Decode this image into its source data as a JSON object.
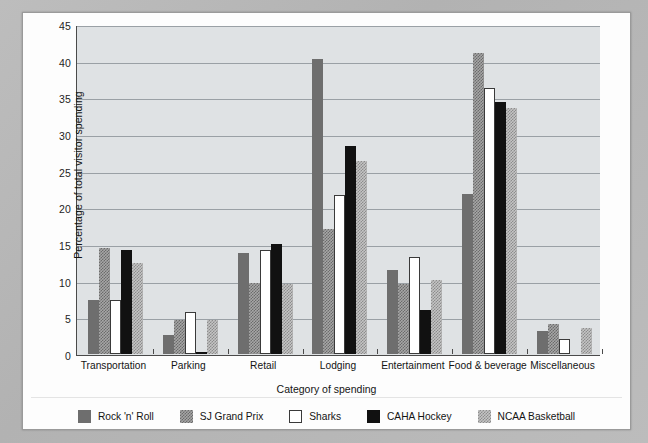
{
  "chart_data": {
    "type": "bar",
    "title": "",
    "xlabel": "Category of spending",
    "ylabel": "Percentage of total visitor spending",
    "ylim": [
      0,
      45
    ],
    "yticks": [
      0,
      5,
      10,
      15,
      20,
      25,
      30,
      35,
      40,
      45
    ],
    "grid": true,
    "legend_position": "bottom",
    "categories": [
      "Transportation",
      "Parking",
      "Retail",
      "Lodging",
      "Entertainment",
      "Food & beverage",
      "Miscellaneous"
    ],
    "series": [
      {
        "name": "Rock 'n' Roll",
        "swatch": "solid-dark-gray",
        "color": "#6e6e6e",
        "values": [
          7.3,
          2.6,
          13.8,
          40.2,
          11.5,
          21.8,
          3.1
        ]
      },
      {
        "name": "SJ Grand Prix",
        "swatch": "checker-mid-gray",
        "color": "#a6a6a6",
        "values": [
          14.4,
          4.7,
          9.7,
          17.1,
          9.5,
          41.0,
          4.1
        ]
      },
      {
        "name": "Sharks",
        "swatch": "white-outlined",
        "color": "#ffffff",
        "values": [
          7.4,
          5.7,
          14.2,
          21.7,
          13.2,
          36.3,
          2.0
        ]
      },
      {
        "name": "CAHA Hockey",
        "swatch": "solid-black",
        "color": "#111111",
        "values": [
          14.2,
          0.3,
          15.0,
          28.3,
          6.0,
          34.4,
          0.0
        ]
      },
      {
        "name": "NCAA Basketball",
        "swatch": "checker-light-gray",
        "color": "#c4c4c4",
        "values": [
          12.4,
          4.7,
          9.5,
          26.3,
          10.1,
          33.6,
          3.6
        ]
      }
    ]
  },
  "legend": {
    "items": [
      {
        "label": "Rock 'n' Roll"
      },
      {
        "label": "SJ Grand Prix"
      },
      {
        "label": "Sharks"
      },
      {
        "label": "CAHA Hockey"
      },
      {
        "label": "NCAA Basketball"
      }
    ]
  }
}
